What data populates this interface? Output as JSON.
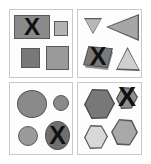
{
  "figure": {
    "title": "",
    "width": 151,
    "height": 164,
    "background": "#ffffff",
    "layout": "2x2 grid of bordered panels, each panel showing one shape category with exactly one shape crossed out by a black X",
    "panel_border_color": "#c9c9c9",
    "panel_background": "#fdfdfd",
    "x_mark_glyph": "X",
    "x_mark_color": "#111111"
  },
  "palette": {
    "dark_gray": "#6f6f6f",
    "medium_gray": "#8a8a8a",
    "light_gray": "#c0c0c0",
    "pale_gray": "#d8d8d8",
    "outline": "#5a5a5a",
    "shadow": "#3d3d3d"
  },
  "panels": [
    {
      "id": "panel-tl",
      "label": "rectangles-panel",
      "category": "rectangle",
      "position": "top-left",
      "shapes": [
        {
          "name": "large-rectangle-marked",
          "kind": "rectangle",
          "fill": "#8a8a8a",
          "marked": true,
          "x_label": "X"
        },
        {
          "name": "small-square-right",
          "kind": "square",
          "fill": "#b3b3b3",
          "marked": false,
          "x_label": ""
        },
        {
          "name": "small-square-bottom-left",
          "kind": "square",
          "fill": "#787878",
          "marked": false,
          "x_label": ""
        },
        {
          "name": "medium-square-bottom-right",
          "kind": "square",
          "fill": "#9a9a9a",
          "marked": false,
          "x_label": ""
        }
      ]
    },
    {
      "id": "panel-tr",
      "label": "triangles-panel",
      "category": "triangle",
      "position": "top-right",
      "shapes": [
        {
          "name": "small-down-triangle",
          "kind": "triangle-down",
          "fill": "#b8b8b8",
          "marked": false,
          "x_label": ""
        },
        {
          "name": "large-left-triangle",
          "kind": "triangle-left",
          "fill": "#a6a6a6",
          "marked": false,
          "x_label": ""
        },
        {
          "name": "rhombus-marked",
          "kind": "rhombus",
          "fill": "#7a7a7a",
          "marked": true,
          "x_label": "X"
        },
        {
          "name": "up-triangle",
          "kind": "triangle-up",
          "fill": "#cfcfcf",
          "marked": false,
          "x_label": ""
        }
      ]
    },
    {
      "id": "panel-bl",
      "label": "circles-panel",
      "category": "circle",
      "position": "bottom-left",
      "shapes": [
        {
          "name": "large-circle",
          "kind": "circle",
          "fill": "#8a8a8a",
          "marked": false,
          "x_label": ""
        },
        {
          "name": "small-circle-right",
          "kind": "circle",
          "fill": "#8a8a8a",
          "marked": false,
          "x_label": ""
        },
        {
          "name": "small-circle-left",
          "kind": "circle",
          "fill": "#9a9a9a",
          "marked": false,
          "x_label": ""
        },
        {
          "name": "ellipse-marked",
          "kind": "ellipse",
          "fill": "#6f6f6f",
          "marked": true,
          "x_label": "X"
        }
      ]
    },
    {
      "id": "panel-br",
      "label": "hexagons-panel",
      "category": "hexagon",
      "position": "bottom-right",
      "shapes": [
        {
          "name": "large-hexagon",
          "kind": "hexagon",
          "fill": "#787878",
          "marked": false,
          "x_label": ""
        },
        {
          "name": "small-hexagon-marked",
          "kind": "hexagon",
          "fill": "#8f8f8f",
          "marked": true,
          "x_label": "X"
        },
        {
          "name": "pale-hexagon",
          "kind": "hexagon",
          "fill": "#d8d8d8",
          "marked": false,
          "x_label": ""
        },
        {
          "name": "medium-hexagon",
          "kind": "hexagon",
          "fill": "#a8a8a8",
          "marked": false,
          "x_label": ""
        }
      ]
    }
  ]
}
